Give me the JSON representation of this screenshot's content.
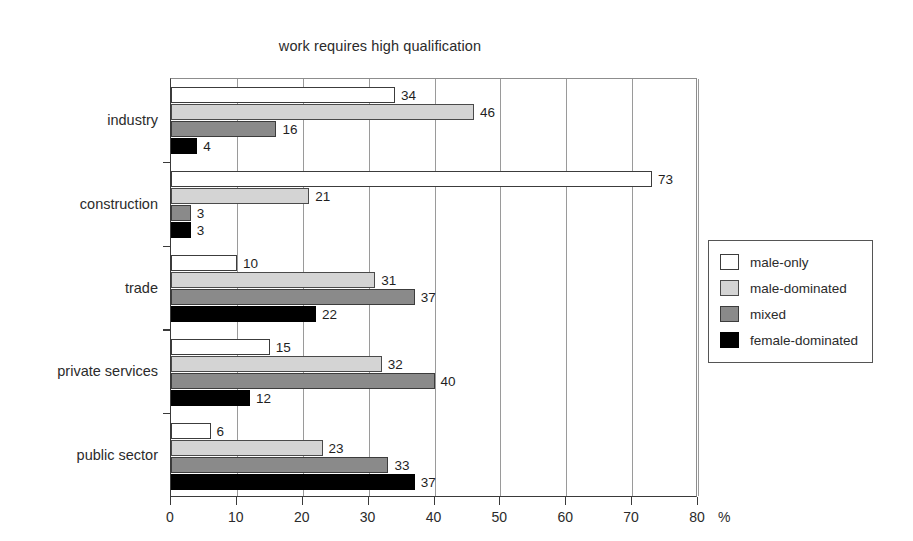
{
  "chart_data": {
    "type": "bar",
    "orientation": "horizontal",
    "title": "work requires high qualification",
    "xlabel": "%",
    "ylabel": "",
    "xlim": [
      0,
      80
    ],
    "xticks": [
      0,
      10,
      20,
      30,
      40,
      50,
      60,
      70,
      80
    ],
    "grid": true,
    "grid_axis": "x",
    "legend_position": "right",
    "categories": [
      "industry",
      "construction",
      "trade",
      "private services",
      "public sector"
    ],
    "series": [
      {
        "name": "male-only",
        "color": "#ffffff",
        "values": [
          34,
          73,
          10,
          15,
          6
        ]
      },
      {
        "name": "male-dominated",
        "color": "#d4d4d4",
        "values": [
          46,
          21,
          31,
          32,
          23
        ]
      },
      {
        "name": "mixed",
        "color": "#8a8a8a",
        "values": [
          16,
          3,
          37,
          40,
          33
        ]
      },
      {
        "name": "female-dominated",
        "color": "#000000",
        "values": [
          4,
          3,
          22,
          12,
          37
        ]
      }
    ]
  },
  "axis": {
    "unit_label": "%",
    "tick_labels": [
      "0",
      "10",
      "20",
      "30",
      "40",
      "50",
      "60",
      "70",
      "80"
    ]
  },
  "legend": {
    "items": [
      {
        "label": "male-only",
        "swatch": "male-only"
      },
      {
        "label": "male-dominated",
        "swatch": "male-dominated"
      },
      {
        "label": "mixed",
        "swatch": "mixed"
      },
      {
        "label": "female-dominated",
        "swatch": "female-dominated"
      }
    ]
  }
}
